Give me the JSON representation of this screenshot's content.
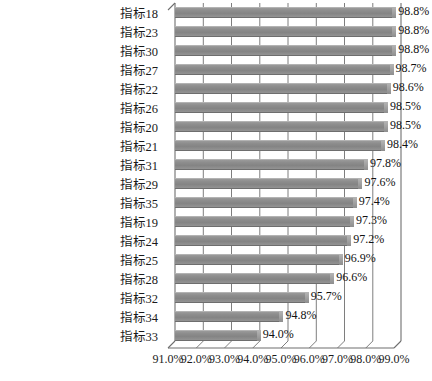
{
  "chart_data": {
    "type": "bar",
    "orientation": "horizontal",
    "title": "",
    "subtitle": "",
    "xlabel": "",
    "ylabel": "",
    "xlim": [
      0.91,
      0.99
    ],
    "grid": true,
    "legend": null,
    "style": "3d",
    "bar_color": "#8d8d8d",
    "value_label_format": "percent_1dp",
    "xtick_labels": [
      "91.0%",
      "92.0%",
      "93.0%",
      "94.0%",
      "95.0%",
      "96.0%",
      "97.0%",
      "98.0%",
      "99.0%"
    ],
    "xtick_values": [
      0.91,
      0.92,
      0.93,
      0.94,
      0.95,
      0.96,
      0.97,
      0.98,
      0.99
    ],
    "categories": [
      "指标18",
      "指标23",
      "指标30",
      "指标27",
      "指标22",
      "指标26",
      "指标20",
      "指标21",
      "指标31",
      "指标29",
      "指标35",
      "指标19",
      "指标24",
      "指标25",
      "指标28",
      "指标32",
      "指标34",
      "指标33"
    ],
    "values": [
      0.988,
      0.988,
      0.988,
      0.987,
      0.986,
      0.985,
      0.985,
      0.984,
      0.978,
      0.976,
      0.974,
      0.973,
      0.972,
      0.969,
      0.966,
      0.957,
      0.948,
      0.94
    ],
    "value_labels": [
      "98.8%",
      "98.8%",
      "98.8%",
      "98.7%",
      "98.6%",
      "98.5%",
      "98.5%",
      "98.4%",
      "97.8%",
      "97.6%",
      "97.4%",
      "97.3%",
      "97.2%",
      "96.9%",
      "96.6%",
      "95.7%",
      "94.8%",
      "94.0%"
    ]
  }
}
